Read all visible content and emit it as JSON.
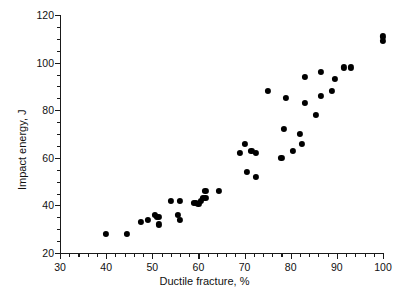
{
  "chart_data": {
    "type": "scatter",
    "title": "",
    "xlabel": "Ductile fracture, %",
    "ylabel": "Impact energy, J",
    "xlim": [
      30,
      100
    ],
    "ylim": [
      20,
      120
    ],
    "xticks": [
      30,
      40,
      50,
      60,
      70,
      80,
      90,
      100
    ],
    "xtick_labels": [
      "30",
      "40",
      "50",
      "60",
      "70",
      "80",
      "90",
      "100"
    ],
    "yticks": [
      20,
      40,
      60,
      80,
      100,
      120
    ],
    "ytick_labels": [
      "20",
      "40",
      "60",
      "80",
      "100",
      "120"
    ],
    "x_minor_step": 2,
    "y_minor_step": 5,
    "grid": false,
    "legend": null,
    "marker": "filled-circle",
    "marker_color": "#000000",
    "points": [
      {
        "x": 40.0,
        "y": 28.0
      },
      {
        "x": 44.5,
        "y": 28.0
      },
      {
        "x": 47.5,
        "y": 33.0
      },
      {
        "x": 49.0,
        "y": 34.0
      },
      {
        "x": 50.5,
        "y": 36.0
      },
      {
        "x": 51.0,
        "y": 35.0
      },
      {
        "x": 51.5,
        "y": 35.0
      },
      {
        "x": 51.5,
        "y": 32.0
      },
      {
        "x": 54.0,
        "y": 42.0
      },
      {
        "x": 55.5,
        "y": 36.0
      },
      {
        "x": 56.0,
        "y": 42.0
      },
      {
        "x": 56.0,
        "y": 34.0
      },
      {
        "x": 59.0,
        "y": 41.0
      },
      {
        "x": 59.5,
        "y": 41.0
      },
      {
        "x": 60.0,
        "y": 40.5
      },
      {
        "x": 60.5,
        "y": 42.0
      },
      {
        "x": 61.0,
        "y": 43.0
      },
      {
        "x": 61.5,
        "y": 43.0
      },
      {
        "x": 61.5,
        "y": 46.0
      },
      {
        "x": 64.5,
        "y": 46.0
      },
      {
        "x": 69.0,
        "y": 62.0
      },
      {
        "x": 70.0,
        "y": 66.0
      },
      {
        "x": 70.5,
        "y": 54.0
      },
      {
        "x": 71.5,
        "y": 63.0
      },
      {
        "x": 72.5,
        "y": 62.0
      },
      {
        "x": 72.5,
        "y": 52.0
      },
      {
        "x": 75.0,
        "y": 88.0
      },
      {
        "x": 78.0,
        "y": 60.0
      },
      {
        "x": 78.5,
        "y": 72.0
      },
      {
        "x": 79.0,
        "y": 85.0
      },
      {
        "x": 80.5,
        "y": 63.0
      },
      {
        "x": 82.0,
        "y": 70.0
      },
      {
        "x": 82.5,
        "y": 66.0
      },
      {
        "x": 83.0,
        "y": 83.0
      },
      {
        "x": 83.0,
        "y": 94.0
      },
      {
        "x": 85.5,
        "y": 78.0
      },
      {
        "x": 86.5,
        "y": 86.0
      },
      {
        "x": 86.5,
        "y": 96.0
      },
      {
        "x": 89.0,
        "y": 88.0
      },
      {
        "x": 89.5,
        "y": 93.0
      },
      {
        "x": 91.5,
        "y": 98.0
      },
      {
        "x": 93.0,
        "y": 98.0
      },
      {
        "x": 100.0,
        "y": 109.0
      },
      {
        "x": 100.0,
        "y": 111.0
      }
    ]
  }
}
